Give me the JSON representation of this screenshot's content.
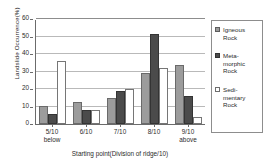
{
  "chart_data": {
    "type": "bar",
    "title": "",
    "xlabel": "Starting point(Division of ridge/10)",
    "ylabel": "Landslide Occurrence(%)",
    "ylim": [
      0,
      60
    ],
    "yticks": [
      0,
      10,
      20,
      30,
      40,
      50,
      60
    ],
    "ytick_labels": [
      "0",
      "10",
      "20",
      "30",
      "40",
      "50",
      "60"
    ],
    "grid": true,
    "legend_position": "right",
    "categories": [
      "5/10 below",
      "6/10",
      "7/10",
      "8/10",
      "9/10 above"
    ],
    "category_lines": [
      {
        "line1": "5/10",
        "line2": "below"
      },
      {
        "line1": "6/10",
        "line2": ""
      },
      {
        "line1": "7/10",
        "line2": ""
      },
      {
        "line1": "8/10",
        "line2": ""
      },
      {
        "line1": "9/10",
        "line2": "above"
      }
    ],
    "series": [
      {
        "name": "Igneous Rock",
        "legend_label": "Igneous\nRock",
        "color": "#9c9c9c",
        "values": [
          10.3,
          12.5,
          15.0,
          29.0,
          34.0
        ]
      },
      {
        "name": "Metamorphic Rock",
        "legend_label": "Meta-\nmorphic\nRock",
        "color": "#4b4b4b",
        "values": [
          5.8,
          8.0,
          19.0,
          51.5,
          16.2
        ]
      },
      {
        "name": "Sedimentary Rock",
        "legend_label": "Sedi-\nmentary\nRock",
        "color": "#ffffff",
        "values": [
          36.0,
          8.2,
          20.0,
          32.0,
          4.0
        ]
      }
    ]
  }
}
